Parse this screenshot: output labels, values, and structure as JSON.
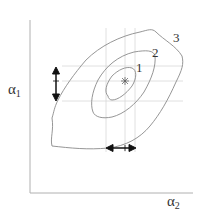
{
  "diagram": {
    "axes": {
      "y_label": "α",
      "y_label_sub": "1",
      "x_label": "α",
      "x_label_sub": "2"
    },
    "contours": [
      {
        "label": "1"
      },
      {
        "label": "2"
      },
      {
        "label": "3"
      }
    ],
    "center_marker": "*",
    "colors": {
      "axis": "#b0b0b0",
      "contour": "#8a8a8a",
      "grid": "#d8d8d8",
      "arrow": "#111111",
      "text": "#333333"
    }
  }
}
